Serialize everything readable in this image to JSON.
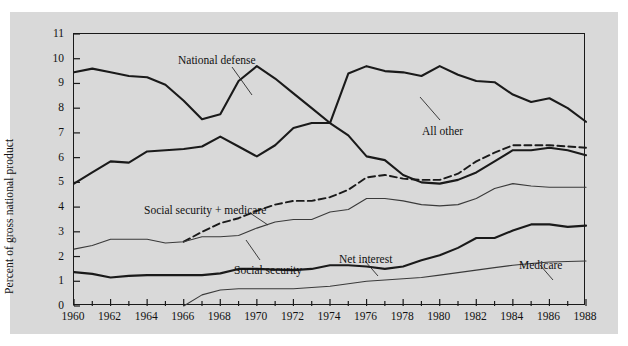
{
  "chart_data": {
    "type": "line",
    "title": "",
    "subtitle": "",
    "xlabel": "",
    "ylabel": "Percent of gross national product",
    "xlim": [
      1960,
      1988
    ],
    "ylim": [
      0,
      11
    ],
    "ytick_labels": [
      "0",
      "1",
      "2",
      "3",
      "4",
      "5",
      "6",
      "7",
      "8",
      "9",
      "10",
      "11"
    ],
    "ytick_values": [
      0,
      1,
      2,
      3,
      4,
      5,
      6,
      7,
      8,
      9,
      10,
      11
    ],
    "xtick_labels": [
      "1960",
      "1962",
      "1964",
      "1966",
      "1968",
      "1970",
      "1972",
      "1974",
      "1976",
      "1978",
      "1980",
      "1982",
      "1984",
      "1986",
      "1988"
    ],
    "xtick_values": [
      1960,
      1962,
      1964,
      1966,
      1968,
      1970,
      1972,
      1974,
      1976,
      1978,
      1980,
      1982,
      1984,
      1986,
      1988
    ],
    "minor_xticks_every": 1,
    "grid": false,
    "legend": "inline-annotations",
    "x": [
      1960,
      1961,
      1962,
      1963,
      1964,
      1965,
      1966,
      1967,
      1968,
      1969,
      1970,
      1971,
      1972,
      1973,
      1974,
      1975,
      1976,
      1977,
      1978,
      1979,
      1980,
      1981,
      1982,
      1983,
      1984,
      1985,
      1986,
      1987,
      1988
    ],
    "series": [
      {
        "name": "National defense",
        "style": "solid",
        "width": 2.1,
        "color": "#1a1a1a",
        "values": [
          9.45,
          9.6,
          9.45,
          9.3,
          9.25,
          8.95,
          8.3,
          7.55,
          7.75,
          9.1,
          9.7,
          9.2,
          8.6,
          8.0,
          7.4,
          6.9,
          6.05,
          5.9,
          5.3,
          5.0,
          4.95,
          5.1,
          5.4,
          5.85,
          6.3,
          6.3,
          6.4,
          6.3,
          6.1
        ]
      },
      {
        "name": "All other",
        "style": "solid",
        "width": 2.1,
        "color": "#1a1a1a",
        "values": [
          4.95,
          5.4,
          5.85,
          5.8,
          6.25,
          6.3,
          6.35,
          6.45,
          6.85,
          6.45,
          6.05,
          6.5,
          7.2,
          7.4,
          7.4,
          9.4,
          9.7,
          9.5,
          9.45,
          9.3,
          9.7,
          9.35,
          9.1,
          9.05,
          8.55,
          8.25,
          8.4,
          8.0,
          7.45
        ]
      },
      {
        "name": "Social security + medicare",
        "style": "dashed",
        "width": 1.9,
        "color": "#1a1a1a",
        "values": [
          null,
          null,
          null,
          null,
          null,
          null,
          2.6,
          3.0,
          3.35,
          3.55,
          3.85,
          4.1,
          4.25,
          4.25,
          4.4,
          4.7,
          5.2,
          5.3,
          5.15,
          5.1,
          5.1,
          5.35,
          5.85,
          6.2,
          6.5,
          6.5,
          6.5,
          6.45,
          6.4
        ]
      },
      {
        "name": "Social security",
        "style": "solid",
        "width": 1.1,
        "color": "#3a3a3a",
        "values": [
          2.3,
          2.45,
          2.7,
          2.7,
          2.7,
          2.55,
          2.6,
          2.8,
          2.8,
          2.85,
          3.15,
          3.4,
          3.5,
          3.5,
          3.8,
          3.9,
          4.35,
          4.35,
          4.25,
          4.1,
          4.05,
          4.1,
          4.35,
          4.75,
          4.95,
          4.85,
          4.8,
          4.8,
          4.8
        ]
      },
      {
        "name": "Net interest",
        "style": "solid",
        "width": 2.1,
        "color": "#1a1a1a",
        "values": [
          1.37,
          1.3,
          1.15,
          1.22,
          1.25,
          1.25,
          1.25,
          1.25,
          1.32,
          1.5,
          1.5,
          1.47,
          1.45,
          1.5,
          1.65,
          1.65,
          1.6,
          1.5,
          1.6,
          1.85,
          2.05,
          2.35,
          2.75,
          2.75,
          3.05,
          3.3,
          3.3,
          3.2,
          3.25
        ]
      },
      {
        "name": "Medicare",
        "style": "solid",
        "width": 1.1,
        "color": "#3a3a3a",
        "values": [
          null,
          null,
          null,
          null,
          null,
          null,
          0.0,
          0.45,
          0.65,
          0.7,
          0.7,
          0.7,
          0.7,
          0.75,
          0.8,
          0.9,
          1.0,
          1.05,
          1.1,
          1.15,
          1.25,
          1.35,
          1.45,
          1.55,
          1.65,
          1.72,
          1.78,
          1.8,
          1.82
        ]
      }
    ],
    "annotations": [
      {
        "name": "National defense",
        "text": "National defense",
        "x": 168,
        "y": 42,
        "leader": [
          [
            222,
            55
          ],
          [
            242,
            83
          ]
        ]
      },
      {
        "name": "All other",
        "text": "All other",
        "x": 412,
        "y": 113,
        "leader": [
          [
            430,
            108
          ],
          [
            410,
            85
          ]
        ]
      },
      {
        "name": "Social security + medicare",
        "text": "Social security + medicare",
        "x": 134,
        "y": 192,
        "leader": [
          [
            240,
            201
          ],
          [
            258,
            213
          ]
        ]
      },
      {
        "name": "Social security",
        "text": "Social security",
        "x": 224,
        "y": 252,
        "leader": [
          [
            250,
            248
          ],
          [
            236,
            228
          ]
        ]
      },
      {
        "name": "Net interest",
        "text": "Net interest",
        "x": 329,
        "y": 241,
        "leader": [
          [
            355,
            249
          ],
          [
            368,
            264
          ]
        ]
      },
      {
        "name": "Medicare",
        "text": "Medicare",
        "x": 509,
        "y": 247,
        "leader": [
          [
            530,
            253
          ],
          [
            543,
            268
          ]
        ]
      }
    ]
  }
}
